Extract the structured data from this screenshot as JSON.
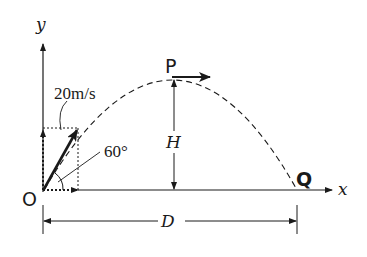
{
  "diagram": {
    "type": "projectile-motion",
    "labels": {
      "y_axis": "y",
      "x_axis": "x",
      "origin": "O",
      "peak": "P",
      "landing": "Q",
      "velocity": "20m/s",
      "angle": "60°",
      "height": "H",
      "range": "D"
    },
    "colors": {
      "stroke": "#1a1a1a",
      "background": "#ffffff"
    }
  }
}
